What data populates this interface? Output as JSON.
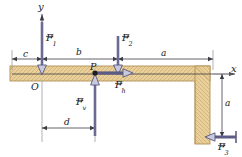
{
  "figure": {
    "type": "free-body-diagram",
    "background_color": "#ffffff"
  },
  "axes": {
    "x_label": "x",
    "y_label": "y",
    "origin_label": "O",
    "axis_color": "#3b3b44",
    "origin": {
      "x": 42,
      "y": 74
    }
  },
  "body": {
    "name": "L-shaped-bracket",
    "fill_color": "#e8cf9a",
    "edge_color": "#b59a63",
    "hatch_color": "#cbad74",
    "horizontal_arm": {
      "x": 10,
      "y": 66,
      "width": 200,
      "height": 15
    },
    "vertical_arm": {
      "x": 195,
      "y": 66,
      "width": 15,
      "height": 78
    }
  },
  "point": {
    "label": "P",
    "x": 95,
    "y": 73,
    "marker_color": "#1d1d22"
  },
  "forces": [
    {
      "id": "F1",
      "label": "F",
      "subscript": "1",
      "direction": "down",
      "tail": {
        "x": 42,
        "y": 22
      },
      "head": {
        "x": 42,
        "y": 74
      },
      "color": "#6b6a94",
      "label_pos": {
        "x": 46,
        "y": 36
      }
    },
    {
      "id": "F2",
      "label": "F",
      "subscript": "2",
      "direction": "down",
      "tail": {
        "x": 118,
        "y": 36
      },
      "head": {
        "x": 118,
        "y": 74
      },
      "color": "#6b6a94",
      "label_pos": {
        "x": 122,
        "y": 37
      }
    },
    {
      "id": "F3",
      "label": "F",
      "subscript": "3",
      "direction": "left",
      "tail": {
        "x": 237,
        "y": 137
      },
      "head": {
        "x": 205,
        "y": 137
      },
      "color": "#6b6a94",
      "label_pos": {
        "x": 222,
        "y": 143
      }
    },
    {
      "id": "Fh",
      "label": "F",
      "subscript": "h",
      "direction": "right",
      "tail": {
        "x": 95,
        "y": 73
      },
      "head": {
        "x": 131,
        "y": 73
      },
      "color": "#6b6a94",
      "label_pos": {
        "x": 117,
        "y": 82
      }
    },
    {
      "id": "Fv",
      "label": "F",
      "subscript": "v",
      "direction": "up",
      "tail": {
        "x": 95,
        "y": 135
      },
      "head": {
        "x": 95,
        "y": 75
      },
      "color": "#6b6a94",
      "label_pos": {
        "x": 80,
        "y": 100
      }
    }
  ],
  "dimensions": [
    {
      "id": "c",
      "label": "c",
      "orientation": "horizontal",
      "from": {
        "x": 12,
        "y": 59
      },
      "to": {
        "x": 42,
        "y": 59
      },
      "label_pos": {
        "x": 25,
        "y": 53
      }
    },
    {
      "id": "b",
      "label": "b",
      "orientation": "horizontal",
      "from": {
        "x": 42,
        "y": 59
      },
      "to": {
        "x": 118,
        "y": 59
      },
      "label_pos": {
        "x": 78,
        "y": 52
      }
    },
    {
      "id": "a-top",
      "label": "a",
      "orientation": "horizontal",
      "from": {
        "x": 118,
        "y": 59
      },
      "to": {
        "x": 213,
        "y": 59
      },
      "label_pos": {
        "x": 163,
        "y": 52
      }
    },
    {
      "id": "d",
      "label": "d",
      "orientation": "horizontal",
      "from": {
        "x": 42,
        "y": 128
      },
      "to": {
        "x": 95,
        "y": 128
      },
      "label_pos": {
        "x": 66,
        "y": 121
      }
    },
    {
      "id": "a-right",
      "label": "a",
      "orientation": "vertical",
      "from": {
        "x": 222,
        "y": 74
      },
      "to": {
        "x": 222,
        "y": 137
      },
      "label_pos": {
        "x": 226,
        "y": 102
      }
    }
  ],
  "colors": {
    "force_arrow": "#6b6a94",
    "force_arrow_fill": "#b8b8d2",
    "dimension_line": "#4a4a52",
    "extension_line": "#8a8a92",
    "text": "#18181c"
  }
}
